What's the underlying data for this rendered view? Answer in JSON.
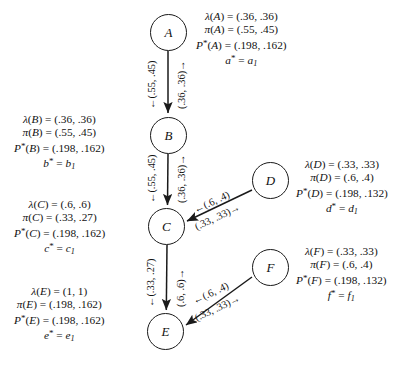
{
  "diagram": {
    "type": "bayesian-network-belief-propagation",
    "nodes": [
      {
        "id": "A",
        "label": "A",
        "x": 168,
        "y": 32
      },
      {
        "id": "B",
        "label": "B",
        "x": 168,
        "y": 135
      },
      {
        "id": "C",
        "label": "C",
        "x": 167,
        "y": 226
      },
      {
        "id": "D",
        "label": "D",
        "x": 270,
        "y": 180
      },
      {
        "id": "E",
        "label": "E",
        "x": 166,
        "y": 331
      },
      {
        "id": "F",
        "label": "F",
        "x": 270,
        "y": 267
      }
    ],
    "edges": [
      {
        "from": "A",
        "to": "B",
        "orientation": "vertical",
        "lambda_label": "←(.55, .45)",
        "pi_label": "(.36, .36)→"
      },
      {
        "from": "B",
        "to": "C",
        "orientation": "vertical",
        "lambda_label": "←(.55, .45)",
        "pi_label": "(.36, .36)→"
      },
      {
        "from": "C",
        "to": "E",
        "orientation": "vertical",
        "lambda_label": "←(.33, .27)",
        "pi_label": "(.6, .6)→"
      },
      {
        "from": "D",
        "to": "C",
        "orientation": "diagonal",
        "lambda_label": "←(.6, .4)",
        "pi_label": "(.33, .33)→"
      },
      {
        "from": "F",
        "to": "E",
        "orientation": "diagonal",
        "lambda_label": "←(.6, .4)",
        "pi_label": "(.33, .33)→"
      }
    ],
    "annotations": [
      {
        "node": "A",
        "side": "right",
        "lambda": {
          "fn": "λ",
          "arg": "A",
          "value": "(.36, .36)"
        },
        "pi": {
          "fn": "π",
          "arg": "A",
          "value": "(.55, .45)"
        },
        "pstar": {
          "fn": "P",
          "arg": "A",
          "value": "(.198, .162)"
        },
        "assign": {
          "var": "a",
          "sub": "1"
        }
      },
      {
        "node": "B",
        "side": "left",
        "lambda": {
          "fn": "λ",
          "arg": "B",
          "value": "(.36, .36)"
        },
        "pi": {
          "fn": "π",
          "arg": "B",
          "value": "(.55, .45)"
        },
        "pstar": {
          "fn": "P",
          "arg": "B",
          "value": "(.198, .162)"
        },
        "assign": {
          "var": "b",
          "sub": "1"
        }
      },
      {
        "node": "C",
        "side": "left",
        "lambda": {
          "fn": "λ",
          "arg": "C",
          "value": "(.6, .6)"
        },
        "pi": {
          "fn": "π",
          "arg": "C",
          "value": "(.33, .27)"
        },
        "pstar": {
          "fn": "P",
          "arg": "C",
          "value": "(.198, .162)"
        },
        "assign": {
          "var": "c",
          "sub": "1"
        }
      },
      {
        "node": "D",
        "side": "right",
        "lambda": {
          "fn": "λ",
          "arg": "D",
          "value": "(.33, .33)"
        },
        "pi": {
          "fn": "π",
          "arg": "D",
          "value": "(.6, .4)"
        },
        "pstar": {
          "fn": "P",
          "arg": "D",
          "value": "(.198, .132)"
        },
        "assign": {
          "var": "d",
          "sub": "1"
        }
      },
      {
        "node": "E",
        "side": "left",
        "lambda": {
          "fn": "λ",
          "arg": "E",
          "value": "(1, 1)"
        },
        "pi": {
          "fn": "π",
          "arg": "E",
          "value": "(.198, .162)"
        },
        "pstar": {
          "fn": "P",
          "arg": "E",
          "value": "(.198, .162)"
        },
        "assign": {
          "var": "e",
          "sub": "1"
        }
      },
      {
        "node": "F",
        "side": "right",
        "lambda": {
          "fn": "λ",
          "arg": "F",
          "value": "(.33, .33)"
        },
        "pi": {
          "fn": "π",
          "arg": "F",
          "value": "(.6, .4)"
        },
        "pstar": {
          "fn": "P",
          "arg": "F",
          "value": "(.198, .132)"
        },
        "assign": {
          "var": "f",
          "sub": "1"
        }
      }
    ],
    "colors": {
      "stroke": "#1a1a1a",
      "background": "#ffffff",
      "text": "#111111"
    }
  }
}
